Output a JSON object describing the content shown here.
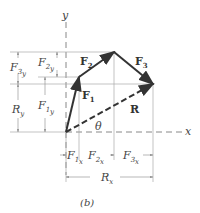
{
  "diagram": {
    "caption": "(b)",
    "axes": {
      "x_label": "x",
      "y_label": "y"
    },
    "vectors": [
      {
        "name": "F1",
        "label": "F",
        "sub": "1"
      },
      {
        "name": "F2",
        "label": "F",
        "sub": "2"
      },
      {
        "name": "F3",
        "label": "F",
        "sub": "3"
      },
      {
        "name": "R",
        "label": "R"
      }
    ],
    "angle_label": "θ",
    "components": {
      "F1y": {
        "base": "F",
        "sub": "1",
        "subsub": "y"
      },
      "F2y": {
        "base": "F",
        "sub": "2",
        "subsub": "y"
      },
      "F3y": {
        "base": "F",
        "sub": "3",
        "subsub": "y"
      },
      "Ry": {
        "base": "R",
        "sub": "y"
      },
      "F1x": {
        "base": "F",
        "sub": "1",
        "subsub": "x"
      },
      "F2x": {
        "base": "F",
        "sub": "2",
        "subsub": "x"
      },
      "F3x": {
        "base": "F",
        "sub": "3",
        "subsub": "x"
      },
      "Rx": {
        "base": "R",
        "sub": "x"
      }
    }
  }
}
